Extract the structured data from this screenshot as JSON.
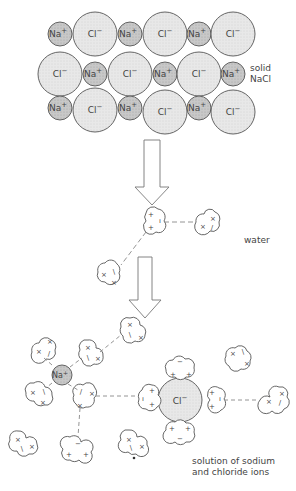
{
  "diagram": {
    "stages": [
      {
        "id": "solid",
        "label_lines": [
          "solid",
          "NaCl"
        ]
      },
      {
        "id": "water",
        "label": "water"
      },
      {
        "id": "solution",
        "label_lines": [
          "solution of sodium",
          "and chloride ions"
        ]
      }
    ],
    "ion_labels": {
      "sodium": "Na",
      "sodium_charge": "+",
      "chloride": "Cl",
      "chloride_charge": "−"
    },
    "colors": {
      "stroke": "#555555",
      "na_fill": "#c9c9c9",
      "cl_fill": "#e6e6e6",
      "text": "#444444"
    },
    "lattice": {
      "rows": [
        [
          "Na",
          "Cl",
          "Na",
          "Cl",
          "Na",
          "Cl"
        ],
        [
          "Cl",
          "Na",
          "Cl",
          "Na",
          "Cl",
          "Na"
        ],
        [
          "Na",
          "Cl",
          "Na",
          "Cl",
          "Na",
          "Cl"
        ]
      ]
    },
    "arrows": [
      {
        "from": "solid",
        "to": "water"
      },
      {
        "from": "water",
        "to": "solution"
      }
    ]
  }
}
